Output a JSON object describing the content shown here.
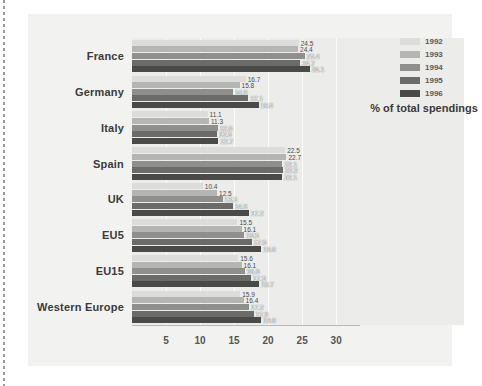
{
  "chart_data": {
    "type": "bar",
    "orientation": "horizontal",
    "title": "",
    "subtitle": "",
    "xlabel": "% of total spendings",
    "ylabel": "",
    "xlim": [
      0,
      33.5
    ],
    "ticks": [
      5,
      10,
      15,
      20,
      25,
      30
    ],
    "grid": true,
    "legend_position": "top-right",
    "categories": [
      "France",
      "Germany",
      "Italy",
      "Spain",
      "UK",
      "EU5",
      "EU15",
      "Western Europe"
    ],
    "series": [
      {
        "name": "1992",
        "color": "#dcdcda",
        "values": [
          24.5,
          16.7,
          11.1,
          22.5,
          10.4,
          15.5,
          15.6,
          15.9
        ]
      },
      {
        "name": "1993",
        "color": "#b5b5b3",
        "values": [
          24.4,
          15.8,
          11.3,
          22.7,
          12.5,
          16.1,
          16.1,
          16.4
        ]
      },
      {
        "name": "1994",
        "color": "#8f8f8d",
        "values": [
          25.4,
          14.8,
          12.6,
          22.1,
          13.3,
          16.5,
          16.6,
          17.2
        ]
      },
      {
        "name": "1995",
        "color": "#6b6b69",
        "values": [
          24.7,
          17.1,
          12.5,
          22.2,
          14.8,
          17.6,
          17.5,
          17.9
        ]
      },
      {
        "name": "1996",
        "color": "#4a4a48",
        "values": [
          26.1,
          18.6,
          12.7,
          22.1,
          17.2,
          19.0,
          18.7,
          19.0
        ]
      }
    ]
  },
  "legend": {
    "items": [
      {
        "label": "1992"
      },
      {
        "label": "1993"
      },
      {
        "label": "1994"
      },
      {
        "label": "1995"
      },
      {
        "label": "1996"
      }
    ]
  },
  "axis_title": "% of total spendings",
  "colors": {
    "card_background": "#f2f2f0",
    "plot_background": "#ececea",
    "gridline": "#ffffff",
    "axis_line": "#b9b9b7",
    "label_text": "#3b3b3b",
    "tick_text": "#555555"
  }
}
